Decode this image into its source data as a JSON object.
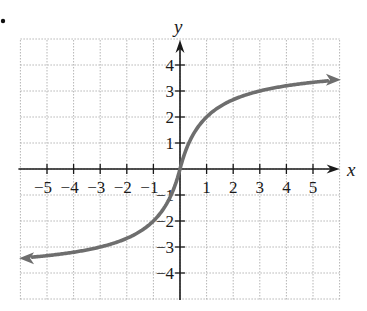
{
  "problem": {
    "bullet": "•"
  },
  "chart_data": {
    "type": "line",
    "title": "",
    "xlabel": "x",
    "ylabel": "y",
    "xlim": [
      -6,
      6
    ],
    "ylim": [
      -5,
      5
    ],
    "grid": true,
    "grid_style": "dotted",
    "x_ticks": [
      -5,
      -4,
      -3,
      -2,
      -1,
      1,
      2,
      3,
      4,
      5
    ],
    "x_tick_labels": [
      "−5",
      "−4",
      "−3",
      "−2",
      "−1",
      "1",
      "2",
      "3",
      "4",
      "5"
    ],
    "y_ticks": [
      -4,
      -3,
      -2,
      -1,
      1,
      2,
      3,
      4
    ],
    "y_tick_labels": [
      "−4",
      "−3",
      "−2",
      "−1",
      "1",
      "2",
      "3",
      "4"
    ],
    "legend": null,
    "series": [
      {
        "name": "f(x)",
        "description": "Increasing S-shaped curve through the origin with horizontal asymptotes near y = 4 and y = −4; arrows at both ends",
        "formula_estimate": "4x/(1+|x|)",
        "x": [
          -6,
          -5,
          -4,
          -3,
          -2,
          -1,
          -0.5,
          0,
          0.5,
          1,
          2,
          3,
          4,
          5,
          6
        ],
        "y": [
          -3.43,
          -3.33,
          -3.2,
          -3.0,
          -2.67,
          -2.0,
          -1.33,
          0,
          1.33,
          2.0,
          2.67,
          3.0,
          3.2,
          3.33,
          3.43
        ],
        "color": "#6e6e6e",
        "arrows": "both"
      }
    ]
  },
  "colors": {
    "axis": "#1a1a1a",
    "grid": "#b5b5b5",
    "curve": "#6e6e6e"
  }
}
